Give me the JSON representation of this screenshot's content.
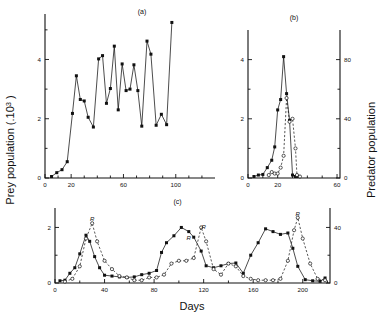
{
  "figure": {
    "xlabel": "Days",
    "ylabel_left": "Prey population (.10",
    "ylabel_left_sup": "3",
    "ylabel_left_tail": " )",
    "ylabel_right": "Predator population",
    "panel_a_label": "(a)",
    "panel_b_label": "(b)",
    "panel_c_label": "(c)",
    "r_annotation": "R"
  },
  "chart_data": [
    {
      "type": "line",
      "title": "(a)",
      "xlabel": "Days",
      "ylabel": "Prey population (.10^3)",
      "xlim": [
        0,
        130
      ],
      "ylim": [
        0,
        5.4
      ],
      "xticks_labeled": [
        0,
        20,
        60,
        100
      ],
      "xticks_minor": [
        10,
        30,
        40,
        50,
        70,
        80,
        90,
        110,
        120
      ],
      "yticks_labeled": [
        0,
        2,
        4
      ],
      "yticks_minor": [
        1,
        3,
        5
      ],
      "grid": false,
      "legend": "none",
      "series": [
        {
          "name": "prey",
          "marker": "filled-square",
          "linestyle": "solid",
          "points": [
            [
              5,
              0.05
            ],
            [
              9,
              0.18
            ],
            [
              13,
              0.28
            ],
            [
              17,
              0.55
            ],
            [
              21,
              2.18
            ],
            [
              24,
              3.45
            ],
            [
              27,
              2.65
            ],
            [
              30,
              2.6
            ],
            [
              33,
              2.05
            ],
            [
              37,
              1.72
            ],
            [
              41,
              4.02
            ],
            [
              44,
              4.13
            ],
            [
              47,
              2.52
            ],
            [
              50,
              3.02
            ],
            [
              53,
              4.45
            ],
            [
              56,
              2.3
            ],
            [
              59,
              3.85
            ],
            [
              62,
              2.95
            ],
            [
              65,
              3.0
            ],
            [
              68,
              3.82
            ],
            [
              71,
              2.95
            ],
            [
              74,
              1.75
            ],
            [
              78,
              4.62
            ],
            [
              81,
              4.18
            ],
            [
              85,
              1.78
            ],
            [
              89,
              2.15
            ],
            [
              93,
              1.8
            ],
            [
              97,
              5.25
            ]
          ]
        }
      ]
    },
    {
      "type": "line",
      "title": "(b)",
      "xlabel": "Days",
      "ylabel_left": "Prey population (.10^3)",
      "ylabel_right": "Predator population",
      "xlim": [
        0,
        62
      ],
      "ylim_left": [
        0,
        5.0
      ],
      "ylim_right": [
        0,
        100
      ],
      "xticks_labeled": [
        0,
        20,
        60
      ],
      "xticks_minor": [
        10,
        30,
        40,
        50
      ],
      "yticks_left_labeled": [
        0,
        2,
        4
      ],
      "yticks_left_minor": [
        1,
        3
      ],
      "yticks_right_labeled": [
        0,
        40,
        80
      ],
      "yticks_right_minor": [
        20,
        60
      ],
      "grid": false,
      "series": [
        {
          "name": "prey",
          "marker": "filled-square",
          "linestyle": "solid",
          "points": [
            [
              4,
              0.05
            ],
            [
              7,
              0.1
            ],
            [
              10,
              0.12
            ],
            [
              13,
              0.35
            ],
            [
              16,
              0.6
            ],
            [
              18,
              1.05
            ],
            [
              20,
              2.3
            ],
            [
              22,
              2.65
            ],
            [
              24,
              4.1
            ],
            [
              26,
              2.85
            ],
            [
              28,
              1.95
            ],
            [
              30,
              0.1
            ],
            [
              32,
              0.05
            ],
            [
              34,
              0.05
            ]
          ]
        },
        {
          "name": "predator",
          "marker": "open-circle",
          "linestyle": "dashed",
          "axis": "right",
          "points": [
            [
              14,
              2
            ],
            [
              16,
              4
            ],
            [
              18,
              3
            ],
            [
              20,
              3
            ],
            [
              22,
              7
            ],
            [
              24,
              15
            ],
            [
              26,
              54
            ],
            [
              28,
              38
            ],
            [
              30,
              40
            ],
            [
              32,
              20
            ],
            [
              33,
              2
            ],
            [
              35,
              1
            ]
          ]
        }
      ]
    },
    {
      "type": "line",
      "title": "(c)",
      "xlabel": "Days",
      "ylabel_left": "Prey population (.10^3)",
      "ylabel_right": "Predator population",
      "xlim": [
        0,
        222
      ],
      "ylim_left": [
        0,
        2.7
      ],
      "ylim_right": [
        0,
        54
      ],
      "xticks_labeled": [
        0,
        40,
        80,
        120,
        160,
        200
      ],
      "xticks_minor": [
        20,
        60,
        100,
        140,
        180,
        220
      ],
      "yticks_left_labeled": [
        0,
        2
      ],
      "yticks_left_minor": [
        1
      ],
      "yticks_right_labeled": [
        0,
        40
      ],
      "yticks_right_minor": [
        20
      ],
      "grid": false,
      "annotations": [
        {
          "text": "R",
          "x": 30,
          "y": 2.25
        },
        {
          "text": "R",
          "x": 108,
          "y": 1.55
        },
        {
          "text": "R",
          "x": 120,
          "y": 1.95
        },
        {
          "text": "R",
          "x": 196,
          "y": 2.42
        }
      ],
      "series": [
        {
          "name": "prey",
          "marker": "filled-square",
          "linestyle": "solid",
          "points": [
            [
              4,
              0.08
            ],
            [
              8,
              0.1
            ],
            [
              12,
              0.35
            ],
            [
              16,
              0.55
            ],
            [
              20,
              1.05
            ],
            [
              25,
              1.72
            ],
            [
              28,
              1.5
            ],
            [
              32,
              0.95
            ],
            [
              36,
              0.55
            ],
            [
              40,
              0.28
            ],
            [
              46,
              0.25
            ],
            [
              52,
              0.22
            ],
            [
              58,
              0.2
            ],
            [
              64,
              0.22
            ],
            [
              70,
              0.3
            ],
            [
              76,
              0.35
            ],
            [
              82,
              0.45
            ],
            [
              86,
              1.1
            ],
            [
              90,
              1.45
            ],
            [
              96,
              1.7
            ],
            [
              102,
              2.0
            ],
            [
              108,
              1.85
            ],
            [
              112,
              1.65
            ],
            [
              118,
              1.15
            ],
            [
              122,
              0.62
            ],
            [
              128,
              0.55
            ],
            [
              134,
              0.62
            ],
            [
              140,
              0.7
            ],
            [
              146,
              0.72
            ],
            [
              152,
              0.35
            ],
            [
              158,
              1.0
            ],
            [
              164,
              1.45
            ],
            [
              170,
              1.95
            ],
            [
              176,
              1.85
            ],
            [
              182,
              1.75
            ],
            [
              188,
              1.8
            ],
            [
              192,
              1.25
            ],
            [
              196,
              0.6
            ],
            [
              202,
              0.12
            ],
            [
              208,
              0.08
            ],
            [
              214,
              0.06
            ],
            [
              218,
              0.18
            ]
          ]
        },
        {
          "name": "predator",
          "marker": "open-circle",
          "linestyle": "dashed",
          "axis": "right",
          "points": [
            [
              8,
              1
            ],
            [
              14,
              3
            ],
            [
              20,
              12
            ],
            [
              25,
              32
            ],
            [
              30,
              43
            ],
            [
              34,
              30
            ],
            [
              40,
              16
            ],
            [
              46,
              10
            ],
            [
              52,
              5
            ],
            [
              58,
              4
            ],
            [
              64,
              2
            ],
            [
              70,
              2
            ],
            [
              76,
              4
            ],
            [
              82,
              4
            ],
            [
              88,
              6
            ],
            [
              94,
              14
            ],
            [
              100,
              16
            ],
            [
              106,
              16
            ],
            [
              112,
              18
            ],
            [
              118,
              40
            ],
            [
              122,
              30
            ],
            [
              128,
              10
            ],
            [
              134,
              6
            ],
            [
              140,
              14
            ],
            [
              146,
              12
            ],
            [
              152,
              5
            ],
            [
              158,
              3
            ],
            [
              164,
              2
            ],
            [
              170,
              2
            ],
            [
              176,
              2
            ],
            [
              182,
              3
            ],
            [
              188,
              16
            ],
            [
              193,
              38
            ],
            [
              196,
              47
            ],
            [
              200,
              32
            ],
            [
              206,
              14
            ],
            [
              212,
              3
            ],
            [
              218,
              2
            ]
          ]
        }
      ]
    }
  ]
}
